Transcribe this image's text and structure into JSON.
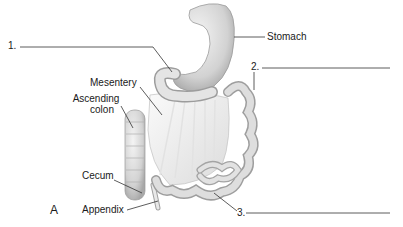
{
  "figure": {
    "panel_letter": "A",
    "labels": {
      "stomach": "Stomach",
      "mesentery": "Mesentery",
      "ascending_colon_line1": "Ascending",
      "ascending_colon_line2": "colon",
      "cecum": "Cecum",
      "appendix": "Appendix"
    },
    "blanks": [
      {
        "number": "1.",
        "answer": ""
      },
      {
        "number": "2.",
        "answer": ""
      },
      {
        "number": "3.",
        "answer": ""
      }
    ]
  }
}
